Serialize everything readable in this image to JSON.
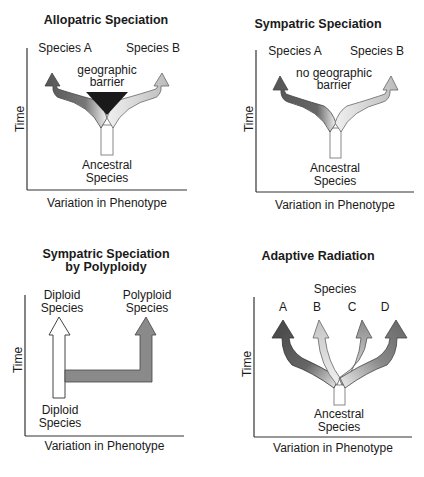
{
  "panels": [
    {
      "title": "Allopatric Speciation",
      "y_axis": "Time",
      "x_axis": "Variation in Phenotype",
      "labels": {
        "left": "Species A",
        "right": "Species B",
        "middle": "geographic barrier",
        "bottom": "Ancestral Species"
      },
      "middle_lines": [
        "geographic",
        "barrier"
      ],
      "bottom_lines": [
        "Ancestral",
        "Species"
      ]
    },
    {
      "title": "Sympatric Speciation",
      "y_axis": "Time",
      "x_axis": "Variation in Phenotype",
      "labels": {
        "left": "Species A",
        "right": "Species B",
        "middle": "no geographic barrier",
        "bottom": "Ancestral Species"
      },
      "middle_lines": [
        "no geographic",
        "barrier"
      ],
      "bottom_lines": [
        "Ancestral",
        "Species"
      ]
    },
    {
      "title": "Sympatric Speciation by Polyploidy",
      "title_lines": [
        "Sympatric Speciation",
        "by Polyploidy"
      ],
      "y_axis": "Time",
      "x_axis": "Variation in Phenotype",
      "top_left_lines": [
        "Diploid",
        "Species"
      ],
      "top_right_lines": [
        "Polyploid",
        "Species"
      ],
      "bottom_lines": [
        "Diploid",
        "Species"
      ]
    },
    {
      "title": "Adaptive Radiation",
      "y_axis": "Time",
      "x_axis": "Variation in Phenotype",
      "species_header": "Species",
      "species": [
        "A",
        "B",
        "C",
        "D"
      ],
      "bottom_lines": [
        "Ancestral",
        "Species"
      ]
    }
  ],
  "colors": {
    "dark_arrow": "#555555",
    "light_arrow": "#bdbdbd",
    "mid_arrow": "#8a8a8a",
    "barrier": "#1a1a1a",
    "axis": "#333333"
  }
}
